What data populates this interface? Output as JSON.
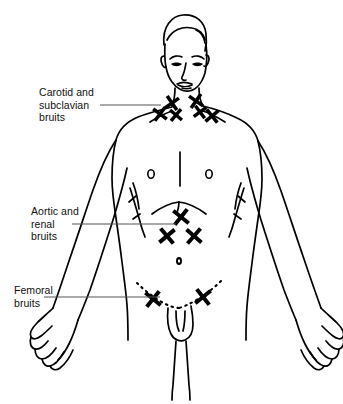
{
  "figure": {
    "marker_glyph": "X",
    "ink_color": "#000000",
    "background_color": "#ffffff",
    "leader_color": "#555555"
  },
  "labels": [
    {
      "id": "carotid",
      "name": "carotid-subclavian-label",
      "lines": [
        "Carotid and",
        "subclavian",
        "bruits"
      ],
      "text": "Carotid and subclavian bruits",
      "leader": {
        "x1": 100,
        "y1": 105,
        "x2": 161,
        "y2": 105
      },
      "marker_count": 6
    },
    {
      "id": "aortic",
      "name": "aortic-renal-label",
      "lines": [
        "Aortic and",
        "renal",
        "bruits"
      ],
      "text": "Aortic and renal bruits",
      "leader": {
        "x1": 72,
        "y1": 224,
        "x2": 176,
        "y2": 224
      },
      "marker_count": 3
    },
    {
      "id": "femoral",
      "name": "femoral-label",
      "lines": [
        "Femoral",
        "bruits"
      ],
      "text": "Femoral bruits",
      "leader": {
        "x1": 44,
        "y1": 297,
        "x2": 160,
        "y2": 297
      },
      "marker_count": 2
    }
  ],
  "markers": {
    "carotid_subclavian": [
      {
        "x": 160,
        "y": 114,
        "size": 7,
        "region": "left-supraclavicular"
      },
      {
        "x": 172,
        "y": 103,
        "size": 7,
        "region": "left-carotid-lower"
      },
      {
        "x": 176,
        "y": 115,
        "size": 6,
        "region": "left-carotid-upper"
      },
      {
        "x": 196,
        "y": 101,
        "size": 7,
        "region": "right-carotid"
      },
      {
        "x": 200,
        "y": 112,
        "size": 6,
        "region": "right-carotid-lower"
      },
      {
        "x": 212,
        "y": 116,
        "size": 7,
        "region": "right-supraclavicular"
      }
    ],
    "aortic_renal": [
      {
        "x": 181,
        "y": 217,
        "size": 8,
        "region": "epigastric-aorta"
      },
      {
        "x": 167,
        "y": 236,
        "size": 8,
        "region": "left-renal"
      },
      {
        "x": 194,
        "y": 236,
        "size": 8,
        "region": "right-renal"
      }
    ],
    "femoral": [
      {
        "x": 153,
        "y": 299,
        "size": 8,
        "region": "left-femoral"
      },
      {
        "x": 203,
        "y": 297,
        "size": 8,
        "region": "right-femoral"
      }
    ]
  },
  "anatomy_details": {
    "navel": {
      "x": 179,
      "y": 261
    },
    "nipples": [
      {
        "x": 151,
        "y": 174
      },
      {
        "x": 209,
        "y": 174
      }
    ],
    "sternum_line": true,
    "costal_margin": true,
    "inguinal_ligaments_dotted": true
  }
}
